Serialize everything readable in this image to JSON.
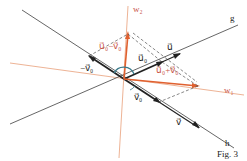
{
  "figure": {
    "caption": "Fig. 3",
    "colors": {
      "black": "#222222",
      "orange": "#e0602f",
      "red_label": "#c9554a",
      "dashed": "#555555",
      "arc": "#3a7a8a"
    },
    "lines": {
      "g": "g",
      "h": "h",
      "w1": "w₁",
      "w2": "w₂"
    },
    "vectors": {
      "u": "u⃗",
      "v": "v⃗",
      "u0": "u⃗₀",
      "v0": "v⃗₀",
      "neg_v0": "−v⃗₀",
      "u0_minus_v0": "u⃗₀−v⃗₀",
      "u0_plus_v0": "u⃗₀+v⃗₀"
    }
  }
}
